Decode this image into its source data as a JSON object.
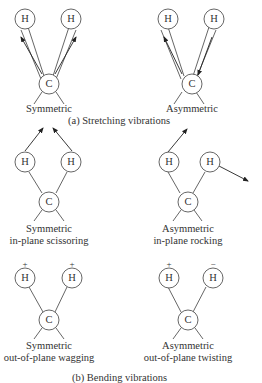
{
  "atoms": {
    "hydrogen": "H",
    "carbon": "C"
  },
  "sections": [
    {
      "caption": "(a) Stretching vibrations",
      "modes": [
        {
          "name": "Symmetric",
          "line2": ""
        },
        {
          "name": "Asymmetric",
          "line2": ""
        }
      ]
    },
    {
      "caption": "(b) Bending vibrations",
      "modes": [
        {
          "name": "Symmetric",
          "line2": "in-plane scissoring"
        },
        {
          "name": "Asymmetric",
          "line2": "in-plane rocking"
        },
        {
          "name": "Symmetric",
          "line2": "out-of-plane wagging",
          "signs": [
            "+",
            "+"
          ]
        },
        {
          "name": "Asymmetric",
          "line2": "out-of-plane twisting",
          "signs": [
            "+",
            "−"
          ]
        }
      ]
    }
  ],
  "colors": {
    "stroke": "#444444",
    "text": "#333333",
    "background": "#ffffff"
  }
}
